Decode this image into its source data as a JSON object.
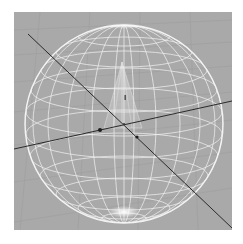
{
  "viewport": {
    "background_color": "#a9a9a9",
    "frame_color": "#ffffff",
    "grid_color": "#9e9e9e",
    "wire_color": "#f2f2f2",
    "axis_color": "#2a2a2a"
  },
  "scene": {
    "objects": [
      {
        "name": "wireframe-sphere",
        "type": "sphere",
        "display": "wireframe",
        "selected": true
      },
      {
        "name": "cone",
        "type": "cone",
        "display": "translucent"
      }
    ],
    "axes": [
      {
        "name": "horizontal-axis"
      },
      {
        "name": "diagonal-axis"
      }
    ],
    "floor_grid": true
  }
}
